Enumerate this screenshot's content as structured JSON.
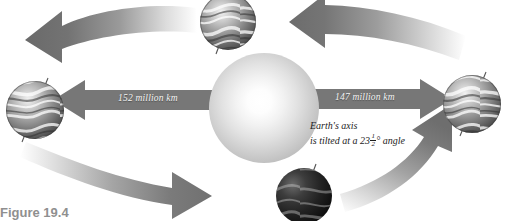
{
  "figure": {
    "caption": "Figure 19.4"
  },
  "sun": {
    "name": "Sun",
    "center_x": 264,
    "center_y": 108,
    "radius": 55
  },
  "distances": [
    {
      "id": "aphelion",
      "label": "152 million km",
      "side": "left",
      "direction": "left"
    },
    {
      "id": "perihelion",
      "label": "147 million km",
      "side": "right",
      "direction": "right"
    }
  ],
  "annotation": {
    "line1": "Earth's axis",
    "line2_before": "is tilted at a 23",
    "fraction_numerator": "1",
    "fraction_denominator": "2",
    "line2_after": "° angle"
  },
  "earths": [
    {
      "id": "earth-left",
      "position": "left",
      "cx": 35,
      "cy": 110,
      "r": 29,
      "shade": "mid"
    },
    {
      "id": "earth-top",
      "position": "top",
      "cx": 228,
      "cy": 22,
      "r": 28,
      "shade": "mid"
    },
    {
      "id": "earth-right",
      "position": "right",
      "cx": 472,
      "cy": 104,
      "r": 29,
      "shade": "mid"
    },
    {
      "id": "earth-bottom",
      "position": "bottom",
      "cx": 304,
      "cy": 196,
      "r": 28,
      "shade": "dark"
    }
  ],
  "orbit_arrows": [
    {
      "id": "arrow-top-left",
      "direction": "left",
      "quadrant": "top-left"
    },
    {
      "id": "arrow-top-right",
      "direction": "left",
      "quadrant": "top-right"
    },
    {
      "id": "arrow-bottom-left",
      "direction": "right",
      "quadrant": "bottom-left"
    },
    {
      "id": "arrow-bottom-right",
      "direction": "up",
      "quadrant": "bottom-right"
    }
  ],
  "colors": {
    "arrow_dark": "#6e6e6e",
    "arrow_light": "#e8e8e8",
    "bar_gray": "#7a7a7a",
    "label_text": "#f4f4f4",
    "annotation_text": "#1d1d1d",
    "caption_text": "#8f8f8f",
    "background": "#ffffff"
  }
}
